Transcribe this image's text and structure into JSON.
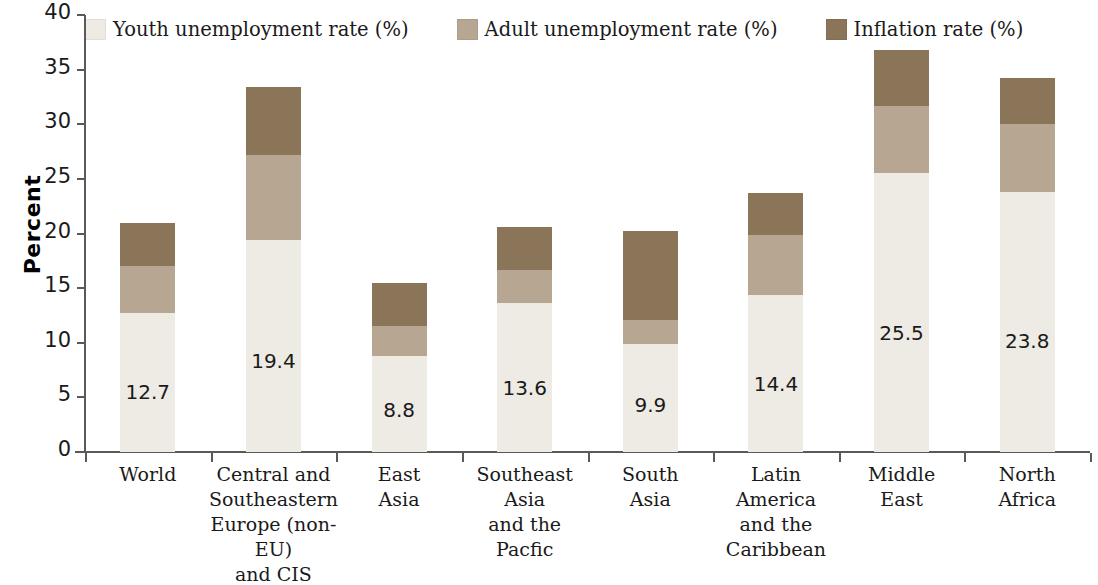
{
  "chart_data": {
    "type": "bar",
    "subtype": "stacked-vertical",
    "title": "",
    "xlabel": "",
    "ylabel": "Percent",
    "ylim": [
      0,
      40
    ],
    "yticks": [
      0,
      5,
      10,
      15,
      20,
      25,
      30,
      35,
      40
    ],
    "grid": false,
    "legend_position": "top",
    "categories": [
      "World",
      "Central and Southeastern Europe (non-EU) and CIS",
      "East Asia",
      "Southeast Asia and the Pacfic",
      "South Asia",
      "Latin America and the Caribbean",
      "Middle East",
      "North Africa"
    ],
    "category_lines": [
      [
        "World"
      ],
      [
        "Central and",
        "Southeastern",
        "Europe (non-EU)",
        "and CIS"
      ],
      [
        "East",
        "Asia"
      ],
      [
        "Southeast",
        "Asia",
        "and the",
        "Pacfic"
      ],
      [
        "South",
        "Asia"
      ],
      [
        "Latin",
        "America",
        "and the",
        "Caribbean"
      ],
      [
        "Middle",
        "East"
      ],
      [
        "North",
        "Africa"
      ]
    ],
    "series": [
      {
        "name": "Youth unemployment rate (%)",
        "color": "#eeeae4",
        "values": [
          12.7,
          19.4,
          8.8,
          13.6,
          9.9,
          14.4,
          25.5,
          23.8
        ],
        "labels": [
          "12.7",
          "19.4",
          "8.8",
          "13.6",
          "9.9",
          "14.4",
          "25.5",
          "23.8"
        ]
      },
      {
        "name": "Adult unemployment rate (%)",
        "color": "#b7a792",
        "values": [
          4.3,
          7.8,
          2.7,
          3.1,
          2.2,
          5.5,
          6.2,
          6.2
        ]
      },
      {
        "name": "Inflation rate (%)",
        "color": "#8a7558",
        "values": [
          4.0,
          6.2,
          4.0,
          3.9,
          8.1,
          3.8,
          5.1,
          4.2
        ]
      }
    ],
    "totals": [
      21.0,
      33.4,
      15.5,
      20.6,
      20.2,
      23.7,
      36.8,
      34.2
    ]
  },
  "legend": {
    "items": [
      {
        "label": "Youth unemployment rate (%)",
        "swatch": "#eeeae4",
        "icon": "legend-swatch-youth"
      },
      {
        "label": "Adult unemployment rate (%)",
        "swatch": "#b7a792",
        "icon": "legend-swatch-adult"
      },
      {
        "label": "Inflation rate (%)",
        "swatch": "#8a7558",
        "icon": "legend-swatch-inflation"
      }
    ]
  },
  "axis": {
    "y_title": "Percent",
    "y_tick_labels": [
      "40",
      "35",
      "30",
      "25",
      "20",
      "15",
      "10",
      "5",
      "0"
    ]
  },
  "colors": {
    "youth": "#eeeae4",
    "adult": "#b7a792",
    "inflation": "#8a7558",
    "axis": "#595959",
    "text": "#1a1a1a",
    "background": "#ffffff"
  }
}
